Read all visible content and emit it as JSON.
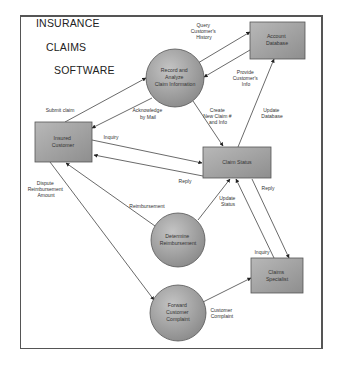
{
  "title": {
    "line1": "INSURANCE",
    "line2": "CLAIMS",
    "line3": "SOFTWARE"
  },
  "nodes": {
    "account_database": {
      "type": "box",
      "lines": [
        "Account",
        "Database"
      ]
    },
    "record_analyze": {
      "type": "process",
      "lines": [
        "Record and",
        "Analyze",
        "Claim Information"
      ]
    },
    "insured_customer": {
      "type": "box",
      "lines": [
        "Insured",
        "Customer"
      ]
    },
    "claim_status": {
      "type": "box",
      "lines": [
        "Claim Status"
      ]
    },
    "determine_reimbursement": {
      "type": "process",
      "lines": [
        "Determine",
        "Reimbursement"
      ]
    },
    "claims_specialist": {
      "type": "box",
      "lines": [
        "Claims",
        "Specialist"
      ]
    },
    "forward_complaint": {
      "type": "process",
      "lines": [
        "Forward",
        "Customer",
        "Complaint"
      ]
    }
  },
  "flows": {
    "submit_claim": {
      "lines": [
        "Submit claim"
      ]
    },
    "acknowledge": {
      "lines": [
        "Acknowledge",
        "by Mail"
      ]
    },
    "query_history": {
      "lines": [
        "Query",
        "Customer's",
        "History"
      ]
    },
    "provide_info": {
      "lines": [
        "Provide",
        "Customer's",
        "Info"
      ]
    },
    "create_claim": {
      "lines": [
        "Create",
        "New Claim #",
        "and Info"
      ]
    },
    "update_database": {
      "lines": [
        "Update",
        "Database"
      ]
    },
    "inquiry_customer": {
      "lines": [
        "Inquiry"
      ]
    },
    "reply_customer": {
      "lines": [
        "Reply"
      ]
    },
    "dispute": {
      "lines": [
        "Dispute",
        "Reimbursement",
        "Amount"
      ]
    },
    "reimbursement": {
      "lines": [
        "Reimbursement"
      ]
    },
    "update_status": {
      "lines": [
        "Update",
        "Status"
      ]
    },
    "reply_specialist": {
      "lines": [
        "Reply"
      ]
    },
    "inquiry_specialist": {
      "lines": [
        "Inquiry"
      ]
    },
    "customer_complaint": {
      "lines": [
        "Customer",
        "Complaint"
      ]
    }
  },
  "colors": {
    "node_fill_light": "#c8c8c8",
    "node_fill_dark": "#8c8c8c",
    "stroke": "#444444",
    "arrow": "#333333"
  }
}
